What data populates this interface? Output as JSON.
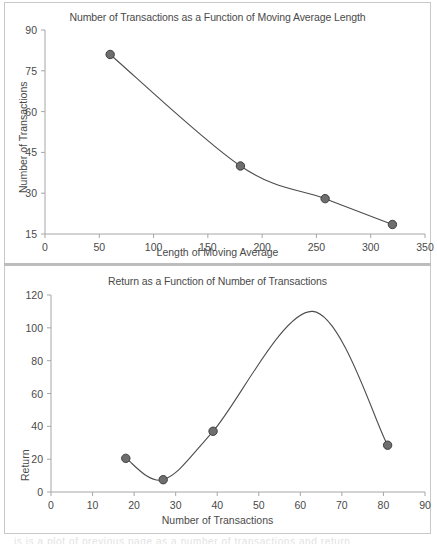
{
  "page": {
    "background": "#ffffff",
    "frame_color": "#c9c9c9",
    "divider_color": "#bdbdbd",
    "cutoff_text": "is is a plot of previous page as a number of transactions and return"
  },
  "style": {
    "line_color": "#4d4d4d",
    "marker_fill": "#6e6e6e",
    "marker_stroke": "#3f3f3f",
    "axis_color": "#a6a6a6",
    "text_color": "#4a4a4a"
  },
  "chart_data": [
    {
      "id": "transactions-vs-ma-length",
      "type": "line",
      "title": "Number of Transactions as a Function of Moving Average Length",
      "xlabel": "Length of Moving Average",
      "ylabel": "Number of Transactions",
      "xlim": [
        0,
        350
      ],
      "ylim": [
        15,
        90
      ],
      "xticks": [
        0,
        50,
        100,
        150,
        200,
        250,
        300,
        350
      ],
      "yticks": [
        15,
        30,
        45,
        60,
        75,
        90
      ],
      "xtick_labels": [
        "0",
        "50",
        "100",
        "150",
        "200",
        "250",
        "300",
        "350"
      ],
      "ytick_labels": [
        "15",
        "30",
        "45",
        "60",
        "75",
        "90"
      ],
      "grid": false,
      "legend": "none",
      "markers": true,
      "series": [
        {
          "name": "Number of Transactions",
          "x": [
            60,
            180,
            258,
            320
          ],
          "y": [
            81,
            40,
            28,
            18.5
          ]
        }
      ]
    },
    {
      "id": "return-vs-transactions",
      "type": "line",
      "title": "Return as a Function of Number of Transactions",
      "xlabel": "Number of Transactions",
      "ylabel": "Return",
      "xlim": [
        0,
        90
      ],
      "ylim": [
        0,
        120
      ],
      "xticks": [
        0,
        10,
        20,
        30,
        40,
        50,
        60,
        70,
        80,
        90
      ],
      "yticks": [
        0,
        20,
        40,
        60,
        80,
        100,
        120
      ],
      "xtick_labels": [
        "0",
        "10",
        "20",
        "30",
        "40",
        "50",
        "60",
        "70",
        "80",
        "90"
      ],
      "ytick_labels": [
        "0",
        "20",
        "40",
        "60",
        "80",
        "100",
        "120"
      ],
      "grid": false,
      "legend": "none",
      "markers": true,
      "annotations": [
        {
          "text": "peak",
          "x": 63,
          "y": 110
        }
      ],
      "series": [
        {
          "name": "Return",
          "x": [
            18,
            27,
            39,
            81
          ],
          "y": [
            20.5,
            7.5,
            37,
            28.5
          ]
        }
      ]
    }
  ]
}
